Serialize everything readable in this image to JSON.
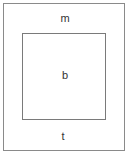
{
  "diagram": {
    "outer_box": {
      "label": "m"
    },
    "inner_box": {
      "label": "b"
    },
    "bottom_label": "t",
    "colors": {
      "border": "#8a8a8a",
      "text": "#333333",
      "background": "#ffffff"
    }
  }
}
